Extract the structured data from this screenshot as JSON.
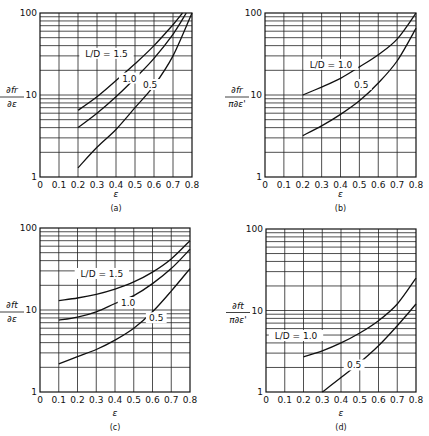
{
  "chart_data": [
    {
      "panel": "(a)",
      "type": "line",
      "xlabel": "ε",
      "ylabel": "∂fr/∂ε",
      "xscale": "linear",
      "yscale": "log",
      "xlim": [
        0,
        0.8
      ],
      "ylim": [
        1,
        100
      ],
      "x_ticks": [
        "0",
        "0.1",
        "0.2",
        "0.3",
        "0.4",
        "0.5",
        "0.6",
        "0.7",
        "0.8"
      ],
      "y_ticks": [
        "1",
        "10",
        "100"
      ],
      "grid": true,
      "series": [
        {
          "name": "L/D = 1.5",
          "label": "L/D = 1.5",
          "x": [
            0.2,
            0.3,
            0.4,
            0.5,
            0.6,
            0.7,
            0.75
          ],
          "y": [
            6.5,
            9.5,
            15,
            24,
            40,
            72,
            100
          ],
          "label_pos": [
            0.35,
            30
          ]
        },
        {
          "name": "1.0",
          "label": "1.0",
          "x": [
            0.2,
            0.3,
            0.4,
            0.5,
            0.6,
            0.7,
            0.77
          ],
          "y": [
            4,
            6,
            9.5,
            16,
            28,
            55,
            100
          ],
          "label_pos": [
            0.47,
            15
          ]
        },
        {
          "name": "0.5",
          "label": "0.5",
          "x": [
            0.2,
            0.3,
            0.4,
            0.5,
            0.6,
            0.7,
            0.8
          ],
          "y": [
            1.3,
            2.3,
            3.8,
            7,
            13,
            30,
            100
          ],
          "label_pos": [
            0.58,
            12.5
          ]
        }
      ]
    },
    {
      "panel": "(b)",
      "type": "line",
      "xlabel": "ε",
      "ylabel": "∂fr/π∂ε'",
      "xscale": "linear",
      "yscale": "log",
      "xlim": [
        0,
        0.8
      ],
      "ylim": [
        1,
        100
      ],
      "x_ticks": [
        "0",
        "0.1",
        "0.2",
        "0.3",
        "0.4",
        "0.5",
        "0.6",
        "0.7",
        "0.8"
      ],
      "y_ticks": [
        "1",
        "10",
        "100"
      ],
      "grid": true,
      "series": [
        {
          "name": "L/D = 1.0",
          "label": "L/D = 1.0",
          "x": [
            0.2,
            0.3,
            0.4,
            0.5,
            0.6,
            0.7,
            0.8
          ],
          "y": [
            10,
            12.5,
            16,
            22,
            31,
            48,
            100
          ],
          "label_pos": [
            0.35,
            22
          ]
        },
        {
          "name": "0.5",
          "label": "0.5",
          "x": [
            0.2,
            0.3,
            0.4,
            0.5,
            0.6,
            0.7,
            0.8
          ],
          "y": [
            3.2,
            4.2,
            5.8,
            8.5,
            14,
            26,
            65
          ],
          "label_pos": [
            0.51,
            12.5
          ]
        }
      ]
    },
    {
      "panel": "(c)",
      "type": "line",
      "xlabel": "ε",
      "ylabel": "∂ft/∂ε",
      "xscale": "linear",
      "yscale": "log",
      "xlim": [
        0,
        0.8
      ],
      "ylim": [
        1,
        100
      ],
      "x_ticks": [
        "0",
        "0.1",
        "0.2",
        "0.3",
        "0.4",
        "0.5",
        "0.6",
        "0.7",
        "0.8"
      ],
      "y_ticks": [
        "1",
        "10",
        "100"
      ],
      "grid": true,
      "series": [
        {
          "name": "L/D = 1.5",
          "label": "L/D = 1.5",
          "x": [
            0.1,
            0.2,
            0.3,
            0.4,
            0.5,
            0.6,
            0.7,
            0.8
          ],
          "y": [
            13,
            14,
            15.5,
            18,
            22,
            29,
            42,
            70
          ],
          "label_pos": [
            0.33,
            26
          ]
        },
        {
          "name": "1.0",
          "label": "1.0",
          "x": [
            0.1,
            0.2,
            0.3,
            0.4,
            0.5,
            0.6,
            0.7,
            0.8
          ],
          "y": [
            7.5,
            8.2,
            9.5,
            12,
            15,
            21,
            32,
            55
          ],
          "label_pos": [
            0.47,
            11.5
          ]
        },
        {
          "name": "0.5",
          "label": "0.5",
          "x": [
            0.1,
            0.2,
            0.3,
            0.4,
            0.5,
            0.6,
            0.7,
            0.8
          ],
          "y": [
            2.2,
            2.7,
            3.3,
            4.3,
            6,
            9.5,
            17,
            32
          ],
          "label_pos": [
            0.62,
            7.5
          ]
        }
      ]
    },
    {
      "panel": "(d)",
      "type": "line",
      "xlabel": "ε",
      "ylabel": "∂ft/π∂ε'",
      "xscale": "linear",
      "yscale": "log",
      "xlim": [
        0,
        0.8
      ],
      "ylim": [
        1,
        100
      ],
      "x_ticks": [
        "0",
        "0.1",
        "0.2",
        "0.3",
        "0.4",
        "0.5",
        "0.6",
        "0.7",
        "0.8"
      ],
      "y_ticks": [
        "1",
        "10",
        "100"
      ],
      "grid": true,
      "series": [
        {
          "name": "L/D = 1.0",
          "label": "L/D = 1.0",
          "x": [
            0.2,
            0.3,
            0.4,
            0.5,
            0.6,
            0.7,
            0.8
          ],
          "y": [
            2.7,
            3.2,
            4,
            5.3,
            7.5,
            12,
            25
          ],
          "label_pos": [
            0.16,
            4.6
          ]
        },
        {
          "name": "0.5",
          "label": "0.5",
          "x": [
            0.3,
            0.4,
            0.5,
            0.6,
            0.7,
            0.8
          ],
          "y": [
            1.0,
            1.5,
            2.3,
            3.7,
            6.5,
            12
          ],
          "label_pos": [
            0.47,
            2.0
          ]
        }
      ]
    }
  ],
  "panels": [
    {
      "id": "a",
      "caption": "(a)",
      "xlabel": "ε",
      "ylabel_num": "∂fr",
      "ylabel_den": "∂ε",
      "frame": {
        "x0": 40,
        "x1": 192,
        "y100": 13,
        "y1": 177
      },
      "caption_y": 211,
      "xlabel_y": 197
    },
    {
      "id": "b",
      "caption": "(b)",
      "xlabel": "ε",
      "ylabel_num": "∂fr",
      "ylabel_den": "π∂ε'",
      "frame": {
        "x0": 265,
        "x1": 416,
        "y100": 13,
        "y1": 177
      },
      "caption_y": 211,
      "xlabel_y": 197
    },
    {
      "id": "c",
      "caption": "(c)",
      "xlabel": "ε",
      "ylabel_num": "∂ft",
      "ylabel_den": "∂ε",
      "frame": {
        "x0": 40,
        "x1": 190,
        "y100": 228,
        "y1": 392
      },
      "caption_y": 430,
      "xlabel_y": 416
    },
    {
      "id": "d",
      "caption": "(d)",
      "xlabel": "ε",
      "ylabel_num": "∂ft",
      "ylabel_den": "π∂ε'",
      "frame": {
        "x0": 266,
        "x1": 416,
        "y100": 229,
        "y1": 392
      },
      "caption_y": 430,
      "xlabel_y": 416
    }
  ]
}
